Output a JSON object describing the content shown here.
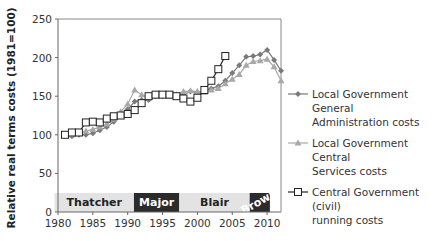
{
  "chart_data": {
    "type": "line",
    "title": "",
    "xlabel": "",
    "ylabel": "Relative real terms costs (1981=100)",
    "xlim": [
      1980,
      2012
    ],
    "ylim": [
      0,
      250
    ],
    "x_ticks": [
      1980,
      1985,
      1990,
      1995,
      2000,
      2005,
      2010
    ],
    "y_ticks": [
      0,
      50,
      100,
      150,
      200,
      250
    ],
    "grid": false,
    "legend_position": "right",
    "series": [
      {
        "name": "Local Government General Administration costs",
        "marker": "diamond",
        "color": "#7a7a7a",
        "x": [
          1981,
          1982,
          1983,
          1984,
          1985,
          1986,
          1987,
          1988,
          1989,
          1990,
          1991,
          1992,
          1993,
          1994,
          1995,
          1996,
          1997,
          1998,
          1999,
          2000,
          2001,
          2002,
          2003,
          2004,
          2005,
          2006,
          2007,
          2008,
          2009,
          2010,
          2011,
          2012
        ],
        "values": [
          100,
          98,
          100,
          100,
          102,
          106,
          110,
          117,
          124,
          133,
          143,
          145,
          145,
          150,
          150,
          153,
          152,
          152,
          156,
          155,
          157,
          160,
          163,
          170,
          180,
          190,
          201,
          202,
          204,
          210,
          197,
          183
        ]
      },
      {
        "name": "Local Government Central Services costs",
        "marker": "triangle",
        "color": "#a8a8a8",
        "x": [
          1981,
          1982,
          1983,
          1984,
          1985,
          1986,
          1987,
          1988,
          1989,
          1990,
          1991,
          1992,
          1993,
          1994,
          1995,
          1996,
          1997,
          1998,
          1999,
          2000,
          2001,
          2002,
          2003,
          2004,
          2005,
          2006,
          2007,
          2008,
          2009,
          2010,
          2011,
          2012
        ],
        "values": [
          100,
          100,
          102,
          105,
          107,
          110,
          114,
          120,
          130,
          140,
          158,
          152,
          148,
          152,
          153,
          150,
          152,
          156,
          157,
          156,
          155,
          158,
          160,
          166,
          172,
          178,
          190,
          195,
          196,
          198,
          188,
          170
        ]
      },
      {
        "name": "Central Government (civil) running costs",
        "marker": "square",
        "color": "#222222",
        "x": [
          1981,
          1982,
          1983,
          1984,
          1985,
          1986,
          1987,
          1988,
          1989,
          1990,
          1991,
          1992,
          1993,
          1994,
          1995,
          1996,
          1997,
          1998,
          1999,
          2000,
          2001,
          2002,
          2003,
          2004
        ],
        "values": [
          100,
          103,
          103,
          116,
          117,
          116,
          121,
          124,
          125,
          127,
          132,
          141,
          150,
          152,
          152,
          152,
          150,
          147,
          143,
          148,
          158,
          170,
          185,
          202
        ]
      }
    ],
    "annotations": [
      {
        "label": "Thatcher",
        "start": 1979.5,
        "end": 1990.9,
        "fill": "#e3e3e3",
        "text_color": "#222222"
      },
      {
        "label": "Major",
        "start": 1990.9,
        "end": 1997.4,
        "fill": "#2b2b2b",
        "text_color": "#ffffff"
      },
      {
        "label": "Blair",
        "start": 1997.4,
        "end": 2007.5,
        "fill": "#e3e3e3",
        "text_color": "#222222"
      },
      {
        "label": "Brown",
        "start": 2007.5,
        "end": 2010.4,
        "fill": "#2b2b2b",
        "text_color": "#ffffff"
      }
    ]
  },
  "legend": {
    "items": [
      {
        "label_line1": "Local Government General",
        "label_line2": "Administration costs"
      },
      {
        "label_line1": "Local Government Central",
        "label_line2": "Services costs"
      },
      {
        "label_line1": "Central Government (civil)",
        "label_line2": "running costs"
      }
    ]
  }
}
